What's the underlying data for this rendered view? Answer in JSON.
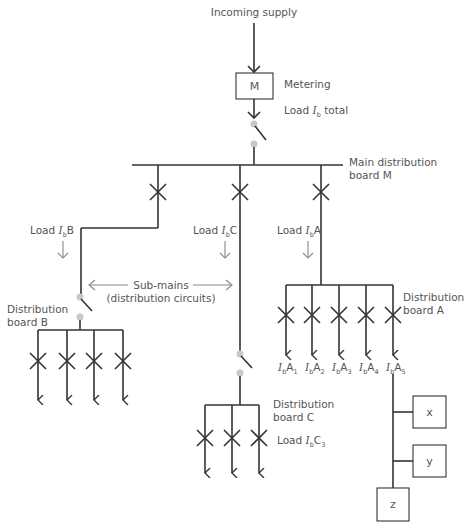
{
  "diagram": {
    "colors": {
      "wire": "#333333",
      "label": "#555555",
      "contact": "#c8c8c8",
      "annotation_arrow": "#888888"
    },
    "incoming": {
      "label": "Incoming supply"
    },
    "meter": {
      "symbol": "M",
      "label": "Metering"
    },
    "total_load": {
      "prefix": "Load ",
      "I": "I",
      "sub": "b",
      "suffix": " total"
    },
    "main_board": {
      "label_line1": "Main distribution",
      "label_line2": "board M"
    },
    "feeders": [
      {
        "id": "B",
        "prefix": "Load ",
        "I": "I",
        "sub": "b",
        "suffix": "B"
      },
      {
        "id": "C",
        "prefix": "Load ",
        "I": "I",
        "sub": "b",
        "suffix": "C"
      },
      {
        "id": "A",
        "prefix": "Load ",
        "I": "I",
        "sub": "b",
        "suffix": "A"
      }
    ],
    "submains": {
      "line1": "Sub-mains",
      "line2": "(distribution circuits)"
    },
    "board_b": {
      "label_line1": "Distribution",
      "label_line2": "board B",
      "circuits": 4
    },
    "board_a": {
      "label_line1": "Distribution",
      "label_line2": "board A",
      "circuits": [
        {
          "I": "I",
          "sub": "b",
          "name": "A",
          "n": "1"
        },
        {
          "I": "I",
          "sub": "b",
          "name": "A",
          "n": "2"
        },
        {
          "I": "I",
          "sub": "b",
          "name": "A",
          "n": "3"
        },
        {
          "I": "I",
          "sub": "b",
          "name": "A",
          "n": "4"
        },
        {
          "I": "I",
          "sub": "b",
          "name": "A",
          "n": "5"
        }
      ]
    },
    "board_c": {
      "label_line1": "Distribution",
      "label_line2": "board C",
      "circuits": 3,
      "load": {
        "prefix": "Load ",
        "I": "I",
        "sub": "b",
        "name": "C",
        "n": "3"
      }
    },
    "final_loads": [
      {
        "label": "x"
      },
      {
        "label": "y"
      },
      {
        "label": "z"
      }
    ]
  }
}
